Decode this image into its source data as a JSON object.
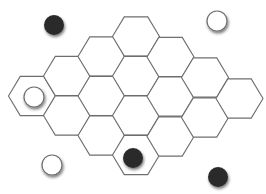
{
  "board": {
    "background": "#ffffff",
    "line_color": "#6e6e6e",
    "hex_radius": 23.5,
    "hex_half_height": 19.6,
    "cells": [
      {
        "col": 0,
        "x": 32,
        "y": 96
      },
      {
        "col": 1,
        "x": 67,
        "y": 76
      },
      {
        "col": 1,
        "x": 67,
        "y": 115.5
      },
      {
        "col": 2,
        "x": 101.5,
        "y": 56.5
      },
      {
        "col": 2,
        "x": 101.5,
        "y": 96
      },
      {
        "col": 2,
        "x": 101.5,
        "y": 135.5
      },
      {
        "col": 3,
        "x": 136,
        "y": 36.5
      },
      {
        "col": 3,
        "x": 136,
        "y": 76
      },
      {
        "col": 3,
        "x": 136,
        "y": 115.5
      },
      {
        "col": 3,
        "x": 136,
        "y": 155
      },
      {
        "col": 4,
        "x": 170.5,
        "y": 57
      },
      {
        "col": 4,
        "x": 170.5,
        "y": 96.5
      },
      {
        "col": 4,
        "x": 170.5,
        "y": 136.5
      },
      {
        "col": 5,
        "x": 205,
        "y": 77.5
      },
      {
        "col": 5,
        "x": 205,
        "y": 117.5
      },
      {
        "col": 6,
        "x": 239.5,
        "y": 98.5
      }
    ]
  },
  "pieces": [
    {
      "id": "black-top-left",
      "color": "black",
      "x": 54,
      "y": 25,
      "r": 10
    },
    {
      "id": "white-top-right",
      "color": "white",
      "x": 217,
      "y": 21,
      "r": 10
    },
    {
      "id": "white-on-board-left",
      "color": "white",
      "x": 34,
      "y": 97,
      "r": 10
    },
    {
      "id": "black-on-board-bottom",
      "color": "black",
      "x": 133,
      "y": 158,
      "r": 10
    },
    {
      "id": "white-bottom-left",
      "color": "white",
      "x": 52,
      "y": 165,
      "r": 10
    },
    {
      "id": "black-bottom-right",
      "color": "black",
      "x": 218,
      "y": 177,
      "r": 10
    }
  ],
  "colors": {
    "black_piece": "#2b2b2b",
    "white_piece": "#ffffff",
    "white_piece_stroke": "#707070",
    "shadow": "#000000"
  }
}
